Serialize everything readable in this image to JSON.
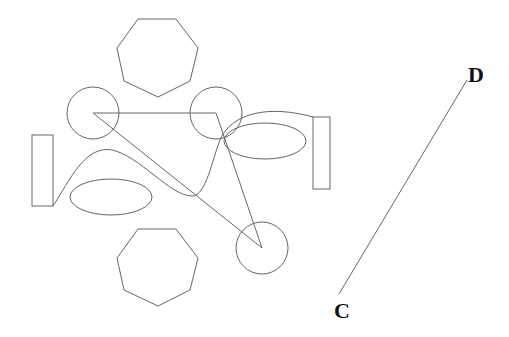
{
  "diagram": {
    "labels": {
      "point_c": "C",
      "point_d": "D"
    },
    "shapes": [
      {
        "type": "heptagon",
        "role": "top"
      },
      {
        "type": "heptagon",
        "role": "bottom"
      },
      {
        "type": "circle",
        "role": "upper-left"
      },
      {
        "type": "circle",
        "role": "upper-right"
      },
      {
        "type": "circle",
        "role": "lower-right"
      },
      {
        "type": "triangle",
        "role": "connecting circle centers"
      },
      {
        "type": "rectangle",
        "role": "left"
      },
      {
        "type": "rectangle",
        "role": "right"
      },
      {
        "type": "ellipse",
        "role": "left"
      },
      {
        "type": "ellipse",
        "role": "right"
      },
      {
        "type": "curve",
        "role": "connecting rectangles"
      },
      {
        "type": "line-segment",
        "role": "CD"
      }
    ],
    "colors": {
      "stroke": "#666666",
      "label": "#111111",
      "background": "#ffffff"
    }
  }
}
